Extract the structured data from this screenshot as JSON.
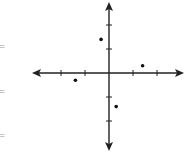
{
  "chart_data": {
    "type": "scatter",
    "title": "",
    "xlabel": "",
    "ylabel": "",
    "xlim": [
      -3,
      3
    ],
    "ylim": [
      -3,
      3
    ],
    "grid": false,
    "legend": null,
    "tick_spacing": 1,
    "x_ticks": [
      -2,
      -1,
      1,
      2
    ],
    "y_ticks": [
      -2,
      -1,
      1,
      2
    ],
    "tick_labels_shown": false,
    "points": [
      {
        "x": -0.33,
        "y": 1.4
      },
      {
        "x": 1.4,
        "y": 0.3
      },
      {
        "x": -1.4,
        "y": -0.3
      },
      {
        "x": 0.3,
        "y": -1.4
      }
    ],
    "axis_color": "#222222",
    "point_color": "#111111"
  },
  "edge_marks": [
    "=",
    "=",
    "="
  ]
}
